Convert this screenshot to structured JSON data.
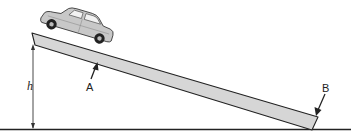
{
  "diagram": {
    "type": "physics-incline",
    "labels": {
      "height": "h",
      "point_a": "A",
      "point_b": "B"
    },
    "colors": {
      "ramp_fill": "#d6d6d6",
      "ramp_stroke": "#222222",
      "car_body": "#c8c8c8",
      "ground": "#222222",
      "background": "#ffffff"
    },
    "objects": [
      "car",
      "inclined-ramp",
      "ground-line",
      "height-arrow",
      "arrow-a",
      "arrow-b"
    ]
  }
}
